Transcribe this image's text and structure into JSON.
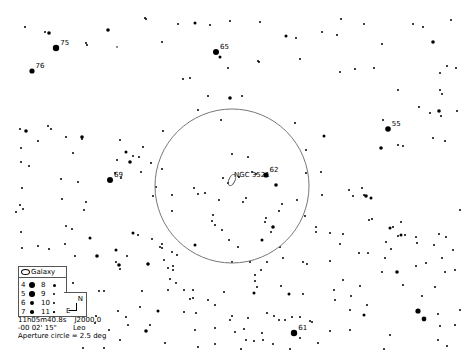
{
  "chart_data": {
    "type": "scatter",
    "target": {
      "name": "NGC 3521",
      "type": "Galaxy",
      "x": 232,
      "y": 180
    },
    "aperture_circle": {
      "cx": 232,
      "cy": 186,
      "r": 77,
      "label": "Aperture circle = 2.5 deg"
    },
    "labeled_stars": [
      {
        "label": "75",
        "x": 56,
        "y": 48,
        "r": 3.2
      },
      {
        "label": "76",
        "x": 32,
        "y": 71,
        "r": 2.6
      },
      {
        "label": "65",
        "x": 216,
        "y": 52,
        "r": 3.0
      },
      {
        "label": "55",
        "x": 388,
        "y": 129,
        "r": 2.8
      },
      {
        "label": "69",
        "x": 110,
        "y": 180,
        "r": 3.0
      },
      {
        "label": "62",
        "x": 266,
        "y": 175,
        "r": 2.6
      },
      {
        "label": "61",
        "x": 294,
        "y": 333,
        "r": 3.2
      }
    ],
    "stars": [
      [
        25,
        27,
        1
      ],
      [
        45,
        32,
        1
      ],
      [
        49,
        33,
        1.8
      ],
      [
        86,
        43,
        1
      ],
      [
        87,
        45,
        1
      ],
      [
        108,
        30,
        1.8
      ],
      [
        117,
        47,
        0.8
      ],
      [
        145,
        18,
        1
      ],
      [
        146,
        19,
        1
      ],
      [
        162,
        42,
        1
      ],
      [
        178,
        24,
        1
      ],
      [
        195,
        23,
        1.5
      ],
      [
        210,
        25,
        1
      ],
      [
        230,
        21,
        1
      ],
      [
        260,
        22,
        1
      ],
      [
        286,
        36,
        1.5
      ],
      [
        220,
        57,
        1.5
      ],
      [
        228,
        68,
        1
      ],
      [
        258,
        61,
        1
      ],
      [
        259,
        62,
        1
      ],
      [
        183,
        79,
        1
      ],
      [
        190,
        78,
        1
      ],
      [
        296,
        38,
        1
      ],
      [
        322,
        32,
        1
      ],
      [
        337,
        35,
        1
      ],
      [
        341,
        19,
        1
      ],
      [
        364,
        24,
        1
      ],
      [
        413,
        24,
        1
      ],
      [
        423,
        27,
        1
      ],
      [
        451,
        20,
        1
      ],
      [
        433,
        42,
        1.8
      ],
      [
        382,
        44,
        1
      ],
      [
        355,
        69,
        1
      ],
      [
        340,
        72,
        1
      ],
      [
        374,
        68,
        1
      ],
      [
        300,
        59,
        1
      ],
      [
        440,
        73,
        1
      ],
      [
        447,
        66,
        1
      ],
      [
        456,
        68,
        1
      ],
      [
        398,
        90,
        1
      ],
      [
        440,
        90,
        1
      ],
      [
        457,
        111,
        1
      ],
      [
        442,
        94,
        1
      ],
      [
        383,
        120,
        1
      ],
      [
        419,
        107,
        1
      ],
      [
        430,
        113,
        1
      ],
      [
        439,
        111,
        1.8
      ],
      [
        441,
        116,
        1
      ],
      [
        381,
        148,
        1.8
      ],
      [
        398,
        145,
        1
      ],
      [
        403,
        146,
        1
      ],
      [
        433,
        138,
        1
      ],
      [
        445,
        141,
        1
      ],
      [
        20,
        129,
        1
      ],
      [
        26,
        131,
        1.8
      ],
      [
        48,
        126,
        1
      ],
      [
        51,
        129,
        1
      ],
      [
        38,
        141,
        1
      ],
      [
        66,
        137,
        1
      ],
      [
        82,
        137,
        1.8
      ],
      [
        82,
        139,
        1
      ],
      [
        73,
        153,
        1
      ],
      [
        21,
        148,
        1
      ],
      [
        21,
        162,
        1
      ],
      [
        29,
        166,
        1
      ],
      [
        61,
        179,
        1
      ],
      [
        78,
        182,
        1
      ],
      [
        22,
        188,
        1
      ],
      [
        62,
        199,
        1
      ],
      [
        23,
        209,
        1
      ],
      [
        66,
        226,
        1
      ],
      [
        90,
        238,
        1.5
      ],
      [
        22,
        248,
        1
      ],
      [
        49,
        249,
        1
      ],
      [
        65,
        244,
        1
      ],
      [
        97,
        256,
        1.8
      ],
      [
        130,
        162,
        1.8
      ],
      [
        117,
        160,
        1
      ],
      [
        120,
        140,
        1
      ],
      [
        115,
        173,
        1
      ],
      [
        121,
        178,
        1
      ],
      [
        126,
        152,
        1.5
      ],
      [
        133,
        156,
        1
      ],
      [
        139,
        157,
        1
      ],
      [
        143,
        147,
        1
      ],
      [
        151,
        163,
        1
      ],
      [
        141,
        172,
        1
      ],
      [
        162,
        169,
        1
      ],
      [
        163,
        131,
        1
      ],
      [
        153,
        196,
        1
      ],
      [
        156,
        187,
        1
      ],
      [
        172,
        211,
        1
      ],
      [
        172,
        195,
        1
      ],
      [
        198,
        194,
        1
      ],
      [
        194,
        188,
        1
      ],
      [
        205,
        193,
        1
      ],
      [
        219,
        200,
        1
      ],
      [
        223,
        178,
        1
      ],
      [
        228,
        183,
        1
      ],
      [
        213,
        215,
        1
      ],
      [
        215,
        225,
        1
      ],
      [
        222,
        230,
        1
      ],
      [
        229,
        240,
        1
      ],
      [
        243,
        202,
        1
      ],
      [
        265,
        222,
        1
      ],
      [
        266,
        218,
        1
      ],
      [
        262,
        240,
        1.5
      ],
      [
        238,
        247,
        1
      ],
      [
        232,
        262,
        1
      ],
      [
        280,
        247,
        1
      ],
      [
        282,
        204,
        1
      ],
      [
        271,
        232,
        1
      ],
      [
        279,
        211,
        1
      ],
      [
        273,
        227,
        1.8
      ],
      [
        212,
        221,
        1
      ],
      [
        152,
        239,
        1
      ],
      [
        162,
        248,
        1
      ],
      [
        160,
        247,
        1
      ],
      [
        177,
        255,
        1
      ],
      [
        172,
        252,
        1
      ],
      [
        195,
        245,
        1.5
      ],
      [
        162,
        244,
        1
      ],
      [
        173,
        266,
        1
      ],
      [
        173,
        270,
        1
      ],
      [
        230,
        98,
        1.8
      ],
      [
        208,
        96,
        1
      ],
      [
        242,
        96,
        1
      ],
      [
        221,
        120,
        1
      ],
      [
        198,
        110,
        1
      ],
      [
        248,
        157,
        1
      ],
      [
        232,
        154,
        1
      ],
      [
        246,
        198,
        1
      ],
      [
        295,
        123,
        1
      ],
      [
        306,
        150,
        1
      ],
      [
        306,
        173,
        1
      ],
      [
        276,
        185,
        1.8
      ],
      [
        239,
        177,
        1
      ],
      [
        252,
        172,
        1
      ],
      [
        256,
        174,
        1
      ],
      [
        297,
        200,
        1
      ],
      [
        324,
        136,
        1.5
      ],
      [
        321,
        172,
        1
      ],
      [
        322,
        195,
        1
      ],
      [
        305,
        216,
        1
      ],
      [
        316,
        227,
        1
      ],
      [
        316,
        232,
        1
      ],
      [
        330,
        233,
        1
      ],
      [
        340,
        244,
        1
      ],
      [
        283,
        258,
        1
      ],
      [
        303,
        262,
        1
      ],
      [
        307,
        264,
        1
      ],
      [
        330,
        261,
        1
      ],
      [
        343,
        234,
        1
      ],
      [
        349,
        190,
        1
      ],
      [
        353,
        196,
        1
      ],
      [
        362,
        188,
        1
      ],
      [
        366,
        196,
        1.8
      ],
      [
        364,
        195,
        1
      ],
      [
        371,
        198,
        1.5
      ],
      [
        372,
        219,
        1
      ],
      [
        390,
        228,
        1.5
      ],
      [
        393,
        227,
        1
      ],
      [
        401,
        235,
        1.5
      ],
      [
        405,
        235,
        1
      ],
      [
        401,
        222,
        1
      ],
      [
        369,
        220,
        1
      ],
      [
        386,
        242,
        1
      ],
      [
        368,
        253,
        1
      ],
      [
        385,
        258,
        1
      ],
      [
        391,
        249,
        1
      ],
      [
        398,
        236,
        1
      ],
      [
        397,
        272,
        1.8
      ],
      [
        439,
        234,
        1
      ],
      [
        446,
        237,
        1
      ],
      [
        417,
        243,
        1
      ],
      [
        416,
        237,
        1
      ],
      [
        442,
        258,
        1
      ],
      [
        434,
        245,
        1
      ],
      [
        360,
        286,
        1
      ],
      [
        334,
        290,
        1
      ],
      [
        343,
        280,
        1
      ],
      [
        359,
        253,
        1
      ],
      [
        382,
        272,
        1
      ],
      [
        416,
        266,
        1
      ],
      [
        426,
        263,
        1
      ],
      [
        445,
        272,
        1
      ],
      [
        435,
        287,
        1
      ],
      [
        422,
        296,
        1
      ],
      [
        403,
        285,
        1
      ],
      [
        351,
        296,
        1
      ],
      [
        335,
        300,
        1
      ],
      [
        367,
        305,
        1
      ],
      [
        350,
        310,
        1
      ],
      [
        364,
        315,
        1.5
      ],
      [
        418,
        311,
        2.6
      ],
      [
        424,
        319,
        2.4
      ],
      [
        438,
        314,
        1
      ],
      [
        440,
        326,
        1
      ],
      [
        453,
        250,
        1
      ],
      [
        455,
        270,
        1
      ],
      [
        460,
        210,
        1
      ],
      [
        460,
        310,
        1
      ],
      [
        104,
        291,
        1
      ],
      [
        99,
        291,
        1
      ],
      [
        116,
        262,
        1
      ],
      [
        119,
        265,
        1.8
      ],
      [
        116,
        250,
        1.5
      ],
      [
        133,
        233,
        1.5
      ],
      [
        138,
        235,
        1
      ],
      [
        127,
        256,
        1
      ],
      [
        120,
        269,
        1
      ],
      [
        148,
        264,
        1.8
      ],
      [
        164,
        260,
        1
      ],
      [
        168,
        268,
        1
      ],
      [
        170,
        279,
        1
      ],
      [
        176,
        283,
        1
      ],
      [
        142,
        291,
        1
      ],
      [
        168,
        290,
        1
      ],
      [
        184,
        290,
        1
      ],
      [
        193,
        290,
        1
      ],
      [
        193,
        298,
        1
      ],
      [
        190,
        299,
        1
      ],
      [
        208,
        300,
        1
      ],
      [
        195,
        330,
        1
      ],
      [
        146,
        331,
        1.8
      ],
      [
        109,
        330,
        1
      ],
      [
        140,
        307,
        1
      ],
      [
        150,
        325,
        1
      ],
      [
        224,
        292,
        1
      ],
      [
        255,
        275,
        1
      ],
      [
        255,
        281,
        1
      ],
      [
        257,
        287,
        1
      ],
      [
        254,
        293,
        1.5
      ],
      [
        250,
        262,
        1
      ],
      [
        261,
        270,
        1
      ],
      [
        267,
        262,
        1
      ],
      [
        281,
        286,
        1
      ],
      [
        289,
        294,
        1.5
      ],
      [
        303,
        294,
        1
      ],
      [
        310,
        321,
        1
      ],
      [
        312,
        322,
        1
      ],
      [
        267,
        313,
        1
      ],
      [
        274,
        316,
        1
      ],
      [
        279,
        320,
        1
      ],
      [
        285,
        320,
        1
      ],
      [
        292,
        317,
        1
      ],
      [
        300,
        317,
        1
      ],
      [
        248,
        318,
        1
      ],
      [
        230,
        320,
        1
      ],
      [
        232,
        316,
        1
      ],
      [
        215,
        305,
        1
      ],
      [
        235,
        332,
        1
      ],
      [
        244,
        329,
        1
      ],
      [
        262,
        333,
        1
      ],
      [
        273,
        344,
        1
      ],
      [
        254,
        341,
        1
      ],
      [
        263,
        340,
        1
      ],
      [
        318,
        343,
        1
      ],
      [
        330,
        331,
        1
      ],
      [
        350,
        330,
        1
      ],
      [
        390,
        335,
        1
      ],
      [
        384,
        349,
        1
      ],
      [
        290,
        349,
        1
      ],
      [
        246,
        340,
        1
      ],
      [
        118,
        311,
        1
      ],
      [
        126,
        317,
        1
      ],
      [
        128,
        325,
        1
      ],
      [
        120,
        340,
        1
      ],
      [
        104,
        348,
        1
      ],
      [
        158,
        311,
        1.5
      ],
      [
        184,
        312,
        1
      ],
      [
        196,
        313,
        1
      ],
      [
        215,
        328,
        1
      ],
      [
        198,
        347,
        1
      ],
      [
        165,
        343,
        1
      ],
      [
        215,
        344,
        1
      ],
      [
        241,
        349,
        1
      ],
      [
        300,
        338,
        1
      ],
      [
        438,
        340,
        1
      ],
      [
        447,
        346,
        1
      ],
      [
        455,
        325,
        1
      ],
      [
        38,
        246,
        1
      ],
      [
        21,
        232,
        1
      ],
      [
        16,
        212,
        1
      ],
      [
        20,
        205,
        1
      ],
      [
        72,
        229,
        1
      ],
      [
        84,
        210,
        1
      ],
      [
        86,
        202,
        1
      ],
      [
        75,
        256,
        1
      ],
      [
        69,
        296,
        1
      ],
      [
        73,
        300,
        1
      ],
      [
        68,
        299,
        1
      ],
      [
        73,
        283,
        1
      ],
      [
        96,
        316,
        1
      ],
      [
        95,
        323,
        1
      ],
      [
        83,
        348,
        1
      ]
    ]
  },
  "legend": {
    "object_type_label": "Galaxy",
    "magnitudes": [
      {
        "mag": "4",
        "r": 3.2,
        "col": 0,
        "row": 0
      },
      {
        "mag": "5",
        "r": 2.8,
        "col": 0,
        "row": 1
      },
      {
        "mag": "6",
        "r": 2.2,
        "col": 0,
        "row": 2
      },
      {
        "mag": "7",
        "r": 1.8,
        "col": 0,
        "row": 3
      },
      {
        "mag": "8",
        "r": 1.5,
        "col": 1,
        "row": 0
      },
      {
        "mag": "9",
        "r": 1.1,
        "col": 1,
        "row": 1
      },
      {
        "mag": "10",
        "r": 0.9,
        "col": 1,
        "row": 2
      },
      {
        "mag": "11",
        "r": 0.6,
        "col": 1,
        "row": 3
      }
    ]
  },
  "compass": {
    "north": "N",
    "east": "E"
  },
  "info": {
    "ra": "11h05m40.8s",
    "epoch": "J2000.0",
    "dec": "-00 02' 15\"",
    "constellation": "Leo",
    "aperture": "Aperture circle = 2.5 deg"
  }
}
